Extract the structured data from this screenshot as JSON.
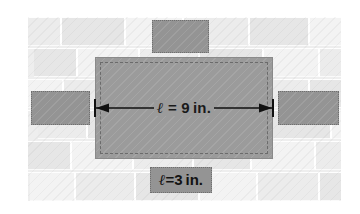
{
  "figure": {
    "name": "brick-wall-tile-dimension-diagram",
    "background_color": "#eeeeee",
    "tile_color": "#949494",
    "center_tile_color": "#9b9b9b",
    "page_color": "#ffffff"
  },
  "labels": {
    "length": {
      "symbol": "ℓ",
      "equals": " = ",
      "value": "9",
      "unit": "in.",
      "full_text": "ℓ = 9 in."
    },
    "width": {
      "symbol": "ℓ",
      "equals": "=",
      "value": "3",
      "unit": "in.",
      "full_text": "ℓ=3 in."
    }
  },
  "dimension_arrow": {
    "name": "double-headed-arrow",
    "direction": "horizontal",
    "has_end_ticks": true,
    "stroke_color": "#111111"
  },
  "tiles": [
    {
      "name": "tile-top",
      "position": "top-center"
    },
    {
      "name": "tile-left",
      "position": "middle-left"
    },
    {
      "name": "tile-right",
      "position": "middle-right"
    },
    {
      "name": "tile-center",
      "position": "center",
      "role": "measured-rectangle"
    },
    {
      "name": "tile-bottom",
      "position": "bottom-center",
      "role": "label-tile"
    }
  ],
  "wall": {
    "rows": [
      {
        "y": 0,
        "offset": -18,
        "widths": [
          52,
          64,
          58,
          66,
          60,
          62,
          58
        ]
      },
      {
        "y": 31,
        "offset": 6,
        "widths": [
          44,
          62,
          60,
          64,
          56,
          62,
          60
        ]
      },
      {
        "y": 62,
        "offset": -24,
        "widths": [
          60,
          58,
          66,
          60,
          62,
          58,
          62
        ]
      },
      {
        "y": 93,
        "offset": 10,
        "widths": [
          50,
          64,
          58,
          62,
          60,
          64,
          58
        ]
      },
      {
        "y": 124,
        "offset": -14,
        "widths": [
          58,
          62,
          60,
          58,
          64,
          60,
          62
        ]
      },
      {
        "y": 155,
        "offset": 2,
        "widths": [
          46,
          60,
          64,
          58,
          62,
          60,
          64
        ]
      }
    ]
  }
}
